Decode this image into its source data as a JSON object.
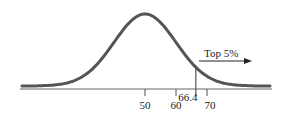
{
  "chart_data": {
    "type": "line",
    "title": "",
    "subtitle": "",
    "xlabel": "",
    "ylabel": "",
    "distribution": {
      "mean": 50,
      "sd": 10
    },
    "x_ticks": [
      50,
      60,
      70
    ],
    "x_tick_labels": [
      "50",
      "60",
      "70"
    ],
    "cutoff": {
      "value": 66.4,
      "label": "66.4"
    },
    "annotation": {
      "text": "Top 5%",
      "arrow": "right"
    },
    "xlim": [
      22,
      78
    ],
    "grid": false,
    "legend": null
  },
  "colors": {
    "curve": "#555555",
    "axis": "#666666",
    "text": "#222222"
  }
}
